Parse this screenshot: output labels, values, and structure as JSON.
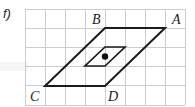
{
  "figure": {
    "label": "f)",
    "type": "parallelogram-with-center-of-symmetry",
    "background_color": "#ffffff",
    "grid": {
      "line_color": "#c9cdd2",
      "origin_x": 25,
      "origin_y": 9,
      "cell_width": 20,
      "cell_height": 19.2,
      "columns": 8,
      "rows": 5,
      "x_lines": [
        25,
        45,
        65,
        85,
        105,
        125,
        145,
        165,
        185
      ],
      "y_lines": [
        9,
        28.2,
        47.4,
        66.6,
        85.8,
        105
      ]
    },
    "outer_shape": {
      "name": "parallelogram-ABDC",
      "stroke_color": "#1b1b1b",
      "stroke_width": 2,
      "points": "105,28 165,28 105,86 45,86",
      "vertices": [
        {
          "id": "B",
          "x": 105,
          "y": 28
        },
        {
          "id": "A",
          "x": 165,
          "y": 28
        },
        {
          "id": "D",
          "x": 105,
          "y": 86
        },
        {
          "id": "C",
          "x": 45,
          "y": 86
        }
      ]
    },
    "inner_shape": {
      "name": "inner-parallelogram",
      "stroke_color": "#1b1b1b",
      "stroke_width": 1.7,
      "points": "105,47 125,47 105,66 85,66"
    },
    "center_point": {
      "name": "center-of-symmetry",
      "x": 105,
      "y": 56.5,
      "radius": 3.2,
      "color": "#111111"
    },
    "labels": [
      {
        "id": "label-B",
        "text": "B",
        "x": 92,
        "y": 24
      },
      {
        "id": "label-A",
        "text": "A",
        "x": 172,
        "y": 24
      },
      {
        "id": "label-C",
        "text": "C",
        "x": 30,
        "y": 101
      },
      {
        "id": "label-D",
        "text": "D",
        "x": 108,
        "y": 101
      }
    ]
  }
}
